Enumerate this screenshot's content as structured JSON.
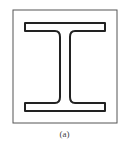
{
  "figure": {
    "caption": "(a)",
    "colors": {
      "frame": "#555555",
      "beam_outline": "#222222",
      "background": "#ffffff"
    }
  }
}
